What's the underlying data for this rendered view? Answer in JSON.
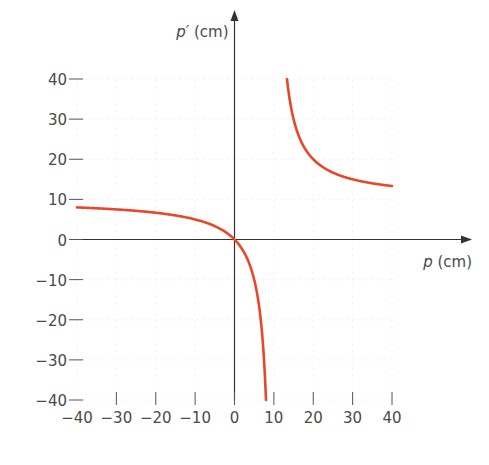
{
  "chart_data": {
    "type": "line",
    "title": "",
    "xlabel": "p (cm)",
    "xlabel_var": "p",
    "xlabel_unit": " (cm)",
    "ylabel": "p′ (cm)",
    "ylabel_var": "p′",
    "ylabel_unit": " (cm)",
    "xlim": [
      -40,
      40
    ],
    "ylim": [
      -40,
      40
    ],
    "x_ticks": [
      -40,
      -30,
      -20,
      -10,
      0,
      10,
      20,
      30,
      40
    ],
    "x_tick_labels": [
      "−40",
      "−30",
      "−20",
      "−10",
      "0",
      "10",
      "20",
      "30",
      "40"
    ],
    "y_ticks": [
      40,
      30,
      20,
      10,
      0,
      -10,
      -20,
      -30,
      -40
    ],
    "y_tick_labels": [
      "40",
      "30",
      "20",
      "10",
      "0",
      "−10",
      "−20",
      "−30",
      "−40"
    ],
    "grid": true,
    "curve_color": "#e8472a",
    "relation": "p′ = f·p / (p − f)",
    "focal_length": 10,
    "series": [
      {
        "name": "lower-branch",
        "x": [
          -40,
          -35,
          -30,
          -25,
          -20,
          -15,
          -10,
          -5,
          0,
          2,
          4,
          6,
          7,
          8
        ],
        "y": [
          8,
          7.78,
          7.5,
          7.14,
          6.67,
          6,
          5,
          3.33,
          0,
          -2.5,
          -6.67,
          -15,
          -23.33,
          -40
        ]
      },
      {
        "name": "upper-branch",
        "x": [
          13.33,
          14,
          15,
          17.5,
          20,
          22.5,
          25,
          30,
          35,
          40
        ],
        "y": [
          40,
          35,
          30,
          23.33,
          20,
          18,
          16.67,
          15,
          14,
          13.33
        ]
      }
    ]
  }
}
